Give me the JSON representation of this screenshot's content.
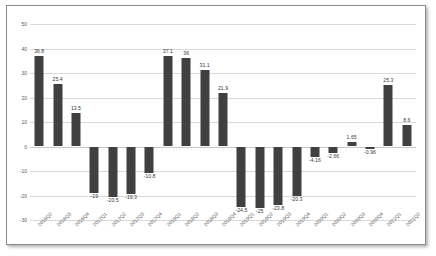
{
  "chart_data": {
    "type": "bar",
    "title": "",
    "subtitle": "",
    "xlabel": "",
    "ylabel": "",
    "ylim": [
      -30,
      50
    ],
    "ytick_step": 10,
    "yticks": [
      50,
      40,
      30,
      20,
      10,
      0,
      -10,
      -20,
      -30
    ],
    "ytick_labels": [
      "50",
      "40",
      "30",
      "20",
      "10",
      "0",
      "-10",
      "-20",
      "-30"
    ],
    "grid": true,
    "legend": "none",
    "bar_color": "#404040",
    "gridline_color": "#d9d9d9",
    "label_color": "#3a3a3a",
    "categories": [
      "2016Q2",
      "2016Q3",
      "2016Q4",
      "2017Q1",
      "2017Q2",
      "2017Q3",
      "2017Q4",
      "2018Q1",
      "2018Q2",
      "2018Q3",
      "2018Q4",
      "2019Q1",
      "2019Q2",
      "2019Q3",
      "2019Q4",
      "2020Q1",
      "2020Q2",
      "2020Q3",
      "2020Q4",
      "2021Q1",
      "2021Q2"
    ],
    "values": [
      36.8,
      25.4,
      13.5,
      -19,
      -20.5,
      -19.3,
      -10.8,
      37.1,
      36,
      31.1,
      21.9,
      -24.5,
      -25,
      -23.8,
      -20.3,
      -4.16,
      -2.66,
      1.65,
      -0.96,
      25.3,
      8.6
    ],
    "value_labels": [
      "36.8",
      "25.4",
      "13.5",
      "-19",
      "-20.5",
      "-19.3",
      "-10.8",
      "37.1",
      "36",
      "31.1",
      "21.9",
      "-24.5",
      "-25",
      "-23.8",
      "-20.3",
      "-4.16",
      "-2.66",
      "1.65",
      "-0.96",
      "25.3",
      "8.6"
    ]
  }
}
